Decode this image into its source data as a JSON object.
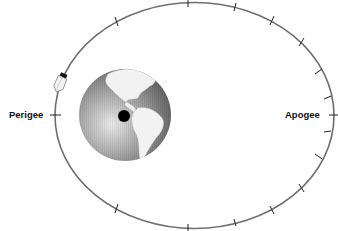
{
  "diagram": {
    "labels": {
      "perigee": "Perigee",
      "apogee": "Apogee"
    },
    "colors": {
      "orbit": "#6e6e6e",
      "ticks": "#222222",
      "earth_dark": "#5a5a5a",
      "earth_light": "#d8d8d8",
      "land": "#f2f2f2",
      "focus_dot": "#000000"
    },
    "orbit": {
      "cx": 194.5,
      "cy": 115.5,
      "rx": 139.5,
      "ry": 113
    },
    "earth": {
      "cx": 125,
      "cy": 115,
      "r": 46
    },
    "focus": {
      "cx": 124,
      "cy": 116,
      "r": 6
    },
    "tick_count_visible": 16
  }
}
